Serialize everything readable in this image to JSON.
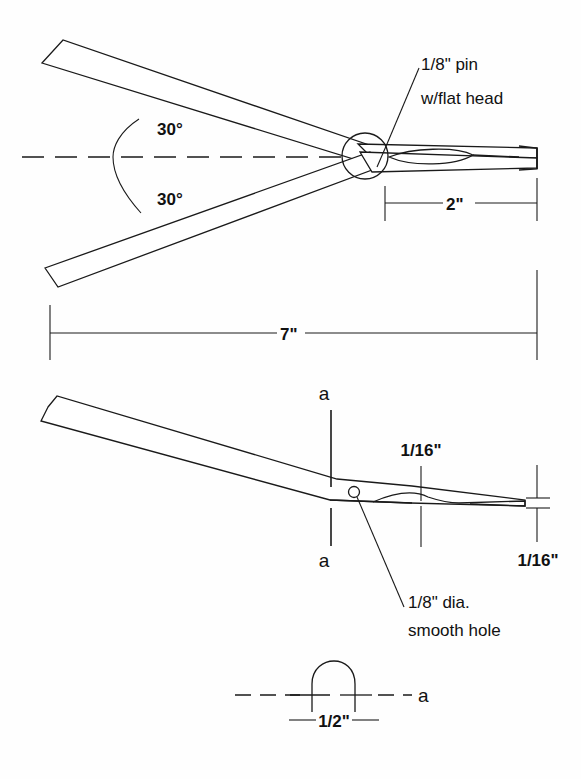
{
  "drawing": {
    "title": "Pliers / plier-style tool mechanical drawing",
    "units": "inches",
    "line_color": "#1a1a1a",
    "background_color": "#fefefe",
    "views": [
      {
        "name": "plan-view",
        "label": ""
      },
      {
        "name": "side-view",
        "label": ""
      },
      {
        "name": "section-view",
        "label": ""
      }
    ]
  },
  "plan_view": {
    "angle_upper": "30°",
    "angle_lower": "30°",
    "pin_note_line1": "1/8\" pin",
    "pin_note_line2": "w/flat head",
    "dim_jaw": "2\"",
    "dim_overall": "7\""
  },
  "side_view": {
    "section_mark_top": "a",
    "section_mark_bottom": "a",
    "dim_hump": "1/16\"",
    "dim_thickness": "1/16\"",
    "hole_note_line1": "1/8\" dia.",
    "hole_note_line2": "smooth hole"
  },
  "section_view": {
    "label": "a",
    "dim_width": "1/2\""
  }
}
